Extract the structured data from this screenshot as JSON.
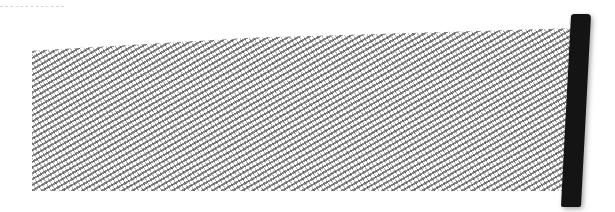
{
  "drawing": {
    "description": "Pencil-textured shaded rectangle with a solid dark bar on the right",
    "colors": {
      "shading": "#4a4a4a",
      "bar": "#141414",
      "background": "#ffffff",
      "dash": "#d8d8d8"
    }
  }
}
